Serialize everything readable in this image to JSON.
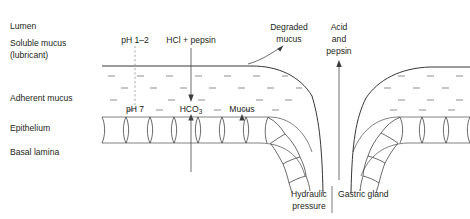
{
  "figure": {
    "background_color": "#ffffff",
    "ink_color": "#231f20"
  },
  "row_labels": [
    {
      "id": "lumen",
      "text": "Lumen"
    },
    {
      "id": "soluble-mucus",
      "text": "Soluble mucus"
    },
    {
      "id": "soluble-mucus-2",
      "text": "(lubricant)"
    },
    {
      "id": "adherent-mucus",
      "text": "Adherent mucus"
    },
    {
      "id": "epithelium",
      "text": "Epithelium"
    },
    {
      "id": "basal-lamina",
      "text": "Basal lamina"
    }
  ],
  "annotations": {
    "ph_lumen": "pH 1–2",
    "ph_epithelium": "pH 7",
    "hcl_pepsin": "HCl + pepsin",
    "bicarbonate": "HCO",
    "bicarbonate_sub": "3",
    "mucus": "Mucus",
    "degraded_mucus_line1": "Degraded",
    "degraded_mucus_line2": "mucus",
    "acid_pepsin_line1": "Acid",
    "acid_pepsin_line2": "and",
    "acid_pepsin_line3": "pepsin",
    "hydraulic_line1": "Hydraulic",
    "hydraulic_line2": "pressure",
    "gastric_gland": "Gastric gland"
  },
  "arrows": [
    {
      "id": "hcl-pepsin-down",
      "direction": "down",
      "label": "HCl + pepsin"
    },
    {
      "id": "bicarbonate-up",
      "direction": "up",
      "label": "HCO3"
    },
    {
      "id": "mucus-up",
      "direction": "up",
      "label": "Mucus"
    },
    {
      "id": "acid-pepsin-up",
      "direction": "up",
      "label": "Acid and pepsin"
    },
    {
      "id": "degraded-mucus-curve",
      "direction": "up-right",
      "label": "Degraded mucus"
    }
  ]
}
